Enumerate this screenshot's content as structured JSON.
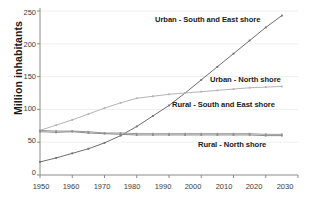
{
  "chart_data": {
    "type": "line",
    "title": "",
    "xlabel": "",
    "ylabel": "Million inhabitants",
    "xlim": [
      1950,
      2030
    ],
    "ylim": [
      0,
      250
    ],
    "grid": true,
    "legend_position": "inline-labels",
    "x_ticks": [
      "1950",
      "1960",
      "1970",
      "1980",
      "1990",
      "2000",
      "2010",
      "2020",
      "2030"
    ],
    "y_ticks": [
      "0",
      "50",
      "100",
      "150",
      "200",
      "250"
    ],
    "x": [
      1950,
      1955,
      1960,
      1965,
      1970,
      1975,
      1980,
      1985,
      1990,
      1995,
      2000,
      2005,
      2010,
      2015,
      2020,
      2025
    ],
    "series": [
      {
        "name": "Urban - South and East shore",
        "color": "#6e6e6e",
        "values": [
          20,
          26,
          33,
          40,
          49,
          60,
          74,
          90,
          106,
          125,
          145,
          165,
          185,
          205,
          225,
          243
        ],
        "label_x": 155,
        "label_y": 15
      },
      {
        "name": "Urban - North shore",
        "color": "#b4b4b4",
        "values": [
          68,
          76,
          84,
          93,
          102,
          110,
          117,
          120,
          123,
          125,
          127,
          129,
          131,
          133,
          134,
          135
        ],
        "label_x": 210,
        "label_y": 75
      },
      {
        "name": "Rural - South and East shore",
        "color": "#9a9a9a",
        "values": [
          68,
          67,
          67,
          66,
          64,
          64,
          63,
          63,
          63,
          63,
          63,
          63,
          63,
          63,
          62,
          62
        ],
        "label_x": 172,
        "label_y": 100
      },
      {
        "name": "Rural - North shore",
        "color": "#8c8c8c",
        "values": [
          66,
          65,
          66,
          64,
          63,
          62,
          61,
          61,
          61,
          61,
          61,
          61,
          61,
          61,
          60,
          60
        ],
        "label_x": 198,
        "label_y": 140
      }
    ]
  }
}
